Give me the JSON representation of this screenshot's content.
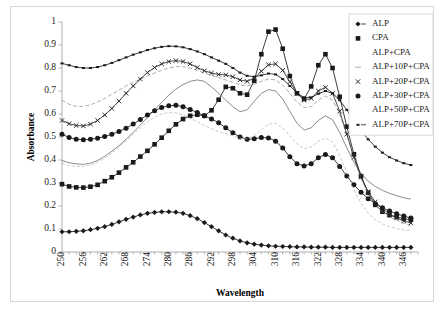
{
  "chart_data": {
    "type": "line",
    "title": "",
    "xlabel": "Wavelength",
    "ylabel": "Absorbance",
    "xlim": [
      250,
      350
    ],
    "ylim": [
      0,
      1
    ],
    "ytick_labels": [
      "0",
      "0.1",
      "0.2",
      "0.3",
      "0.4",
      "0.5",
      "0.6",
      "0.7",
      "0.8",
      "0.9",
      "1"
    ],
    "ytick_values": [
      0,
      0.1,
      0.2,
      0.3,
      0.4,
      0.5,
      0.6,
      0.7,
      0.8,
      0.9,
      1
    ],
    "xtick_labels": [
      "250",
      "256",
      "262",
      "268",
      "274",
      "280",
      "286",
      "292",
      "298",
      "304",
      "310",
      "316",
      "322",
      "328",
      "334",
      "340",
      "346"
    ],
    "xtick_values": [
      250,
      256,
      262,
      268,
      274,
      280,
      286,
      292,
      298,
      304,
      310,
      316,
      322,
      328,
      334,
      340,
      346
    ],
    "minor_tick_step": 2,
    "grid": false,
    "legend_position": "top-right",
    "x": [
      250,
      252,
      254,
      256,
      258,
      260,
      262,
      264,
      266,
      268,
      270,
      272,
      274,
      276,
      278,
      280,
      282,
      284,
      286,
      288,
      290,
      292,
      294,
      296,
      298,
      300,
      302,
      304,
      306,
      308,
      310,
      312,
      314,
      316,
      318,
      320,
      322,
      324,
      326,
      328,
      330,
      332,
      334,
      336,
      338,
      340,
      342,
      344,
      346,
      348
    ],
    "series": [
      {
        "name": "ALP",
        "marker": "diamond",
        "color": "#1a1a1a",
        "values": [
          0.088,
          0.088,
          0.09,
          0.092,
          0.097,
          0.103,
          0.11,
          0.12,
          0.131,
          0.142,
          0.152,
          0.161,
          0.168,
          0.172,
          0.175,
          0.175,
          0.173,
          0.168,
          0.158,
          0.145,
          0.128,
          0.11,
          0.092,
          0.074,
          0.06,
          0.048,
          0.04,
          0.034,
          0.03,
          0.027,
          0.025,
          0.024,
          0.023,
          0.022,
          0.022,
          0.021,
          0.021,
          0.021,
          0.02,
          0.02,
          0.02,
          0.02,
          0.02,
          0.02,
          0.02,
          0.02,
          0.02,
          0.02,
          0.02,
          0.02
        ]
      },
      {
        "name": "CPA",
        "marker": "square",
        "color": "#1a1a1a",
        "values": [
          0.295,
          0.285,
          0.281,
          0.28,
          0.284,
          0.292,
          0.308,
          0.325,
          0.345,
          0.368,
          0.39,
          0.415,
          0.44,
          0.468,
          0.497,
          0.527,
          0.555,
          0.578,
          0.592,
          0.597,
          0.592,
          0.616,
          0.662,
          0.718,
          0.712,
          0.69,
          0.684,
          0.745,
          0.86,
          0.958,
          0.967,
          0.884,
          0.765,
          0.69,
          0.665,
          0.72,
          0.812,
          0.86,
          0.8,
          0.675,
          0.545,
          0.425,
          0.33,
          0.258,
          0.205,
          0.175,
          0.16,
          0.152,
          0.145,
          0.14
        ]
      },
      {
        "name": "ALP+CPA",
        "marker": "none",
        "color": "#5a5a5a",
        "values": [
          0.398,
          0.388,
          0.383,
          0.381,
          0.386,
          0.398,
          0.416,
          0.438,
          0.462,
          0.49,
          0.52,
          0.552,
          0.585,
          0.618,
          0.65,
          0.682,
          0.708,
          0.728,
          0.742,
          0.748,
          0.742,
          0.718,
          0.69,
          0.66,
          0.632,
          0.61,
          0.618,
          0.655,
          0.69,
          0.706,
          0.7,
          0.665,
          0.612,
          0.56,
          0.53,
          0.54,
          0.572,
          0.592,
          0.575,
          0.52,
          0.452,
          0.39,
          0.342,
          0.308,
          0.285,
          0.268,
          0.255,
          0.245,
          0.236,
          0.23
        ]
      },
      {
        "name": "ALP+10P+CPA",
        "marker": "none",
        "color": "#8a8a8a",
        "values": [
          0.66,
          0.642,
          0.634,
          0.633,
          0.64,
          0.652,
          0.668,
          0.686,
          0.704,
          0.722,
          0.738,
          0.752,
          0.766,
          0.778,
          0.79,
          0.8,
          0.806,
          0.806,
          0.8,
          0.79,
          0.778,
          0.768,
          0.758,
          0.748,
          0.738,
          0.726,
          0.722,
          0.73,
          0.742,
          0.752,
          0.748,
          0.726,
          0.69,
          0.652,
          0.628,
          0.632,
          0.66,
          0.678,
          0.66,
          0.6,
          0.51,
          0.41,
          0.32,
          0.252,
          0.205,
          0.175,
          0.155,
          0.138,
          0.125,
          0.115
        ]
      },
      {
        "name": "ALP+20P+CPA",
        "marker": "cross",
        "color": "#2a2a2a",
        "values": [
          0.572,
          0.558,
          0.55,
          0.548,
          0.556,
          0.572,
          0.596,
          0.624,
          0.656,
          0.69,
          0.722,
          0.752,
          0.78,
          0.802,
          0.818,
          0.828,
          0.832,
          0.828,
          0.818,
          0.802,
          0.788,
          0.778,
          0.772,
          0.77,
          0.762,
          0.748,
          0.742,
          0.756,
          0.786,
          0.814,
          0.818,
          0.79,
          0.74,
          0.69,
          0.66,
          0.668,
          0.7,
          0.716,
          0.69,
          0.612,
          0.512,
          0.412,
          0.325,
          0.262,
          0.218,
          0.188,
          0.165,
          0.148,
          0.135,
          0.126
        ]
      },
      {
        "name": "ALP+30P+CPA",
        "marker": "circle",
        "color": "#1a1a1a",
        "values": [
          0.512,
          0.498,
          0.49,
          0.488,
          0.49,
          0.495,
          0.502,
          0.512,
          0.524,
          0.538,
          0.556,
          0.576,
          0.596,
          0.614,
          0.628,
          0.636,
          0.638,
          0.632,
          0.62,
          0.606,
          0.592,
          0.578,
          0.562,
          0.54,
          0.518,
          0.5,
          0.49,
          0.492,
          0.498,
          0.496,
          0.482,
          0.452,
          0.414,
          0.384,
          0.374,
          0.384,
          0.41,
          0.424,
          0.41,
          0.372,
          0.33,
          0.292,
          0.26,
          0.232,
          0.21,
          0.192,
          0.178,
          0.166,
          0.156,
          0.148
        ]
      },
      {
        "name": "ALP+50P+CPA",
        "marker": "none",
        "color": "#b0b0b0",
        "values": [
          0.385,
          0.376,
          0.372,
          0.372,
          0.378,
          0.39,
          0.408,
          0.43,
          0.456,
          0.484,
          0.512,
          0.54,
          0.566,
          0.586,
          0.6,
          0.606,
          0.604,
          0.596,
          0.582,
          0.566,
          0.55,
          0.536,
          0.524,
          0.514,
          0.504,
          0.494,
          0.492,
          0.506,
          0.532,
          0.556,
          0.56,
          0.54,
          0.505,
          0.47,
          0.45,
          0.456,
          0.482,
          0.496,
          0.478,
          0.42,
          0.345,
          0.272,
          0.212,
          0.168,
          0.14,
          0.122,
          0.11,
          0.102,
          0.096,
          0.092
        ]
      },
      {
        "name": "ALP+70P+CPA",
        "marker": "smalldash",
        "color": "#1a1a1a",
        "values": [
          0.82,
          0.812,
          0.804,
          0.8,
          0.8,
          0.804,
          0.812,
          0.822,
          0.834,
          0.846,
          0.858,
          0.868,
          0.878,
          0.886,
          0.892,
          0.895,
          0.894,
          0.89,
          0.882,
          0.872,
          0.86,
          0.846,
          0.832,
          0.818,
          0.8,
          0.78,
          0.766,
          0.762,
          0.768,
          0.776,
          0.772,
          0.752,
          0.722,
          0.692,
          0.672,
          0.672,
          0.688,
          0.7,
          0.69,
          0.66,
          0.618,
          0.572,
          0.528,
          0.49,
          0.458,
          0.432,
          0.412,
          0.398,
          0.386,
          0.378
        ]
      }
    ]
  },
  "legend": {
    "items": [
      {
        "label": "ALP",
        "marker": "diamond"
      },
      {
        "label": "CPA",
        "marker": "square"
      },
      {
        "label": "ALP+CPA",
        "marker": "none"
      },
      {
        "label": "ALP+10P+CPA",
        "marker": "dash"
      },
      {
        "label": "ALP+20P+CPA",
        "marker": "cross"
      },
      {
        "label": "ALP+30P+CPA",
        "marker": "circle"
      },
      {
        "label": "ALP+50P+CPA",
        "marker": "none"
      },
      {
        "label": "ALP+70P+CPA",
        "marker": "smalldash"
      }
    ]
  }
}
